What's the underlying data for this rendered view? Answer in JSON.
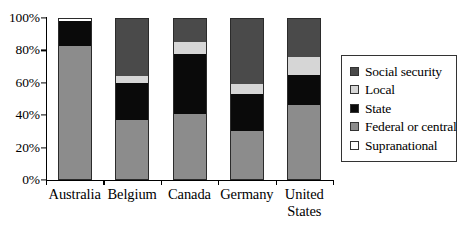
{
  "chart_data": {
    "type": "bar",
    "subtype": "stacked-percentage-column",
    "title": "",
    "xlabel": "",
    "ylabel": "",
    "ylim": [
      0,
      100
    ],
    "yunit": "%",
    "grid": false,
    "legend_position": "right",
    "categories": [
      "Australia",
      "Belgium",
      "Canada",
      "Germany",
      "United States"
    ],
    "ytick_labels": [
      "0%",
      "20%",
      "40%",
      "60%",
      "80%",
      "100%"
    ],
    "ytick_values": [
      0,
      20,
      40,
      60,
      80,
      100
    ],
    "series": [
      {
        "name": "Federal or central",
        "color": "#8c8c8c",
        "values": [
          83,
          37,
          41,
          30,
          46
        ]
      },
      {
        "name": "State",
        "color": "#0a0a0a",
        "values": [
          15,
          23,
          37,
          23,
          19
        ]
      },
      {
        "name": "Local",
        "color": "#d6d6d6",
        "values": [
          0,
          4,
          7,
          6,
          11
        ]
      },
      {
        "name": "Social security",
        "color": "#4a4a4a",
        "values": [
          0,
          36,
          15,
          41,
          24
        ]
      },
      {
        "name": "Supranational",
        "color": "#ffffff",
        "values": [
          2,
          0,
          0,
          0,
          0
        ]
      }
    ],
    "legend_entries": [
      {
        "label": "Social security",
        "color": "#4a4a4a"
      },
      {
        "label": "Local",
        "color": "#d6d6d6"
      },
      {
        "label": "State",
        "color": "#0a0a0a"
      },
      {
        "label": "Federal or central",
        "color": "#8c8c8c"
      },
      {
        "label": "Supranational",
        "color": "#ffffff"
      }
    ]
  },
  "xlabels": [
    "Australia",
    "Belgium",
    "Canada",
    "Germany",
    "United\nStates"
  ]
}
